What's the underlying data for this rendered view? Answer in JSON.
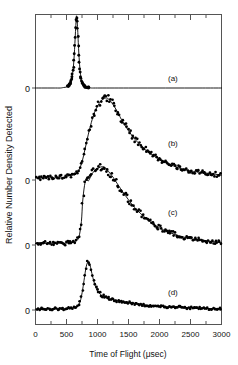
{
  "figure": {
    "title": "",
    "background_color": "#ffffff",
    "frame_color": "#555555",
    "data_color": "#000000",
    "fit_color": "#000000"
  },
  "axes": {
    "xlabel": "Time of Flight (μsec)",
    "ylabel": "Relative Number Density Detected",
    "x_ticks": [
      0,
      500,
      1000,
      1500,
      2000,
      2500,
      3000
    ],
    "x_tick_labels": [
      "0",
      "500",
      "1000",
      "1500",
      "2000",
      "2500",
      "3000"
    ],
    "x_minor_step": 250,
    "xlim": [
      0,
      3000
    ],
    "y_zero_labels": [
      "0",
      "0",
      "0",
      "0"
    ],
    "y_ticks_shown": false,
    "grid": false
  },
  "panels": [
    {
      "id": "a",
      "label": "(a)"
    },
    {
      "id": "b",
      "label": "(b)"
    },
    {
      "id": "c",
      "label": "(c)"
    },
    {
      "id": "d",
      "label": "(d)"
    }
  ],
  "chart_data": {
    "type": "line",
    "title": "",
    "xlabel": "Time of Flight (μsec)",
    "ylabel": "Relative Number Density Detected",
    "xlim": [
      0,
      3000
    ],
    "grid": false,
    "legend": "none",
    "note": "Four stacked time-of-flight distributions; each panel has its own zero baseline. Markers are measured points, solid curve is the fit.",
    "series": [
      {
        "name": "(a)",
        "panel": "a",
        "baseline_zero": 0,
        "peak_x": 660,
        "peak_y": 1.55,
        "marker": "filled-circle",
        "x": [
          0,
          100,
          200,
          300,
          400,
          450,
          500,
          530,
          560,
          580,
          600,
          615,
          630,
          640,
          650,
          660,
          670,
          680,
          690,
          700,
          715,
          730,
          750,
          775,
          800,
          850,
          900,
          1000,
          1200,
          1500,
          1800,
          2100,
          2400,
          2700,
          3000
        ],
        "y": [
          0.0,
          0.0,
          0.0,
          0.0,
          0.0,
          0.01,
          0.02,
          0.04,
          0.09,
          0.17,
          0.32,
          0.5,
          0.8,
          1.05,
          1.3,
          1.5,
          1.42,
          1.22,
          0.95,
          0.7,
          0.42,
          0.25,
          0.12,
          0.05,
          0.02,
          0.01,
          0.0,
          0.0,
          0.0,
          0.0,
          0.0,
          0.0,
          0.0,
          0.0,
          0.0
        ]
      },
      {
        "name": "(b)",
        "panel": "b",
        "baseline_zero": 0,
        "peak_x": 1150,
        "peak_y": 1.0,
        "marker": "filled-circle",
        "x": [
          0,
          75,
          150,
          225,
          300,
          375,
          450,
          525,
          600,
          650,
          700,
          750,
          800,
          850,
          900,
          950,
          1000,
          1050,
          1100,
          1150,
          1200,
          1250,
          1300,
          1350,
          1400,
          1500,
          1600,
          1700,
          1800,
          1900,
          2000,
          2100,
          2200,
          2300,
          2400,
          2500,
          2600,
          2700,
          2800,
          2900,
          3000
        ],
        "y": [
          0.03,
          0.02,
          0.04,
          0.03,
          0.02,
          0.04,
          0.03,
          0.05,
          0.06,
          0.07,
          0.12,
          0.22,
          0.38,
          0.55,
          0.7,
          0.82,
          0.9,
          0.96,
          0.99,
          1.0,
          0.97,
          0.92,
          0.86,
          0.79,
          0.72,
          0.6,
          0.5,
          0.42,
          0.35,
          0.3,
          0.25,
          0.21,
          0.18,
          0.15,
          0.13,
          0.11,
          0.1,
          0.09,
          0.08,
          0.07,
          0.06
        ]
      },
      {
        "name": "(c)",
        "panel": "c",
        "baseline_zero": 0,
        "peak_x": 1100,
        "peak_y": 1.0,
        "marker": "filled-circle",
        "x": [
          0,
          75,
          150,
          225,
          300,
          375,
          450,
          525,
          600,
          650,
          700,
          740,
          760,
          790,
          820,
          850,
          880,
          920,
          960,
          1000,
          1050,
          1100,
          1150,
          1200,
          1250,
          1300,
          1400,
          1500,
          1600,
          1700,
          1800,
          1900,
          2000,
          2100,
          2200,
          2300,
          2400,
          2500,
          2600,
          2700,
          2800,
          2900,
          3000
        ],
        "y": [
          0.02,
          0.03,
          0.02,
          0.03,
          0.02,
          0.03,
          0.02,
          0.03,
          0.04,
          0.05,
          0.1,
          0.3,
          0.55,
          0.76,
          0.84,
          0.82,
          0.86,
          0.92,
          0.96,
          0.98,
          1.0,
          1.0,
          0.97,
          0.92,
          0.87,
          0.81,
          0.69,
          0.58,
          0.48,
          0.4,
          0.33,
          0.27,
          0.22,
          0.18,
          0.15,
          0.12,
          0.1,
          0.08,
          0.07,
          0.06,
          0.05,
          0.04,
          0.03
        ]
      },
      {
        "name": "(d)",
        "panel": "d",
        "baseline_zero": 0,
        "peak_x": 850,
        "peak_y": 1.0,
        "marker": "filled-circle",
        "x": [
          0,
          75,
          150,
          225,
          300,
          375,
          450,
          525,
          600,
          650,
          700,
          730,
          760,
          790,
          810,
          830,
          850,
          870,
          890,
          910,
          940,
          970,
          1000,
          1050,
          1100,
          1150,
          1200,
          1300,
          1400,
          1500,
          1600,
          1700,
          1800,
          1900,
          2000,
          2100,
          2200,
          2300,
          2400,
          2500,
          2600,
          2700,
          2800,
          2900,
          3000
        ],
        "y": [
          0.02,
          0.02,
          0.03,
          0.02,
          0.03,
          0.02,
          0.02,
          0.03,
          0.04,
          0.06,
          0.12,
          0.22,
          0.42,
          0.68,
          0.85,
          0.96,
          1.0,
          0.97,
          0.88,
          0.76,
          0.6,
          0.48,
          0.4,
          0.32,
          0.28,
          0.25,
          0.23,
          0.2,
          0.17,
          0.15,
          0.13,
          0.12,
          0.1,
          0.09,
          0.08,
          0.07,
          0.06,
          0.06,
          0.05,
          0.05,
          0.04,
          0.04,
          0.03,
          0.03,
          0.02
        ]
      }
    ]
  }
}
